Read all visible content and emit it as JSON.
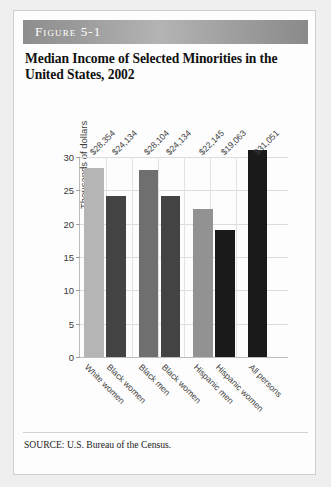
{
  "figure": {
    "banner_label": "Figure 5-1",
    "title_line1": "Median Income of Selected Minorities in the",
    "title_line2": "United States, 2002",
    "source_note": "SOURCE: U.S. Bureau of the Census."
  },
  "chart_data": {
    "type": "bar",
    "title": "Median Income of Selected Minorities in the United States, 2002",
    "xlabel": "",
    "ylabel": "Thousands of dollars",
    "ylim": [
      0,
      30
    ],
    "yticks": [
      0,
      5,
      10,
      15,
      20,
      25,
      30
    ],
    "ytick_labels": [
      "0",
      "5",
      "10",
      "15",
      "20",
      "25",
      "30"
    ],
    "grid": true,
    "legend": "none",
    "categories": [
      "White women",
      "Black women",
      "Black men",
      "Black women",
      "Hispanic men",
      "Hispanic women",
      "All persons"
    ],
    "values": [
      28.354,
      24.134,
      28.104,
      24.134,
      22.145,
      19.063,
      31.051
    ],
    "value_labels": [
      "$28,354",
      "$24,134",
      "$28,104",
      "$24,134",
      "$22,145",
      "$19,063",
      "$31,051"
    ],
    "bar_colors": [
      "#b5b5b5",
      "#434343",
      "#6f6f6f",
      "#434343",
      "#929292",
      "#1a1a1a",
      "#1a1a1a"
    ],
    "units": "thousands of dollars"
  }
}
